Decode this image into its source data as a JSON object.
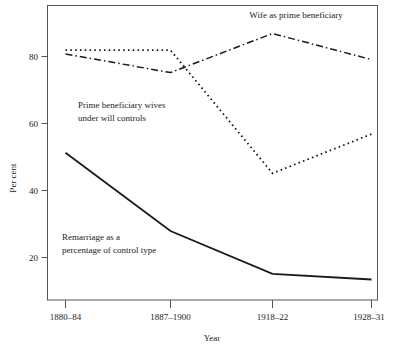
{
  "chart_data": {
    "type": "line",
    "title": "",
    "xlabel": "Year",
    "ylabel": "Per cent",
    "categories": [
      "1880–84",
      "1887–1900",
      "1918–22",
      "1928–31"
    ],
    "yticks": [
      20,
      40,
      60,
      80
    ],
    "ylim": [
      13,
      92
    ],
    "grid": false,
    "legend_position": "inline-annotations",
    "series": [
      {
        "name": "Wife as prime beneficiary",
        "style": "dash-dot",
        "values": [
          79.0,
          74.0,
          84.5,
          77.5
        ]
      },
      {
        "name": "Prime beneficiary wives under will controls",
        "style": "dotted",
        "values": [
          80.0,
          80.0,
          47.0,
          57.5
        ]
      },
      {
        "name": "Remarriage as a percentage of control type",
        "style": "solid",
        "values": [
          52.5,
          31.5,
          20.0,
          18.5
        ]
      }
    ],
    "annotations": [
      {
        "text": "Wife as prime beneficiary",
        "x": 296,
        "y": 18
      },
      {
        "text": "Prime beneficiary wives",
        "x": 78,
        "y": 108
      },
      {
        "text": "under will controls",
        "x": 78,
        "y": 121
      },
      {
        "text": "Remarriage as a",
        "x": 62,
        "y": 240
      },
      {
        "text": "percentage of control type",
        "x": 62,
        "y": 253
      }
    ]
  },
  "axis": {
    "y_label": "Per cent",
    "x_label": "Year",
    "y_tick_labels": [
      "80",
      "60",
      "40",
      "20"
    ],
    "x_tick_labels": [
      "1880–84",
      "1887–1900",
      "1918–22",
      "1928–31"
    ]
  },
  "annotations": {
    "wife": "Wife as prime beneficiary",
    "prime_line1": "Prime beneficiary wives",
    "prime_line2": "under will controls",
    "remarriage_line1": "Remarriage as a",
    "remarriage_line2": "percentage of control type"
  },
  "colors": {
    "ink": "#1a1a1a",
    "frame": "#555555",
    "background": "#ffffff"
  }
}
